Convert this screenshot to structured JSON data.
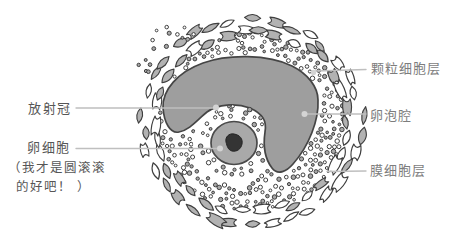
{
  "labels": {
    "corona": "放射冠",
    "egg": "卵细胞",
    "egg_note_line1": "（我才是圆滚滚",
    "egg_note_line2": "的好吧！ ）",
    "granulosa": "颗粒细胞层",
    "antrum": "卵泡腔",
    "theca": "膜细胞层"
  },
  "colors": {
    "background": "#ffffff",
    "antrum_fill": "#9e9e9e",
    "egg_fill": "#a9a9a9",
    "nucleus_fill": "#343434",
    "cell_outline": "#3f3f3f",
    "theca_cell_fill": "#b2b2b2",
    "cell_white_fill": "#ffffff",
    "dot_gray_fill": "#a8a8a8",
    "leader_line": "#bfbfbf",
    "leader_dot": "#d4d4d4",
    "label_text_left": "#565656",
    "label_text_right": "#7d7d7d"
  }
}
